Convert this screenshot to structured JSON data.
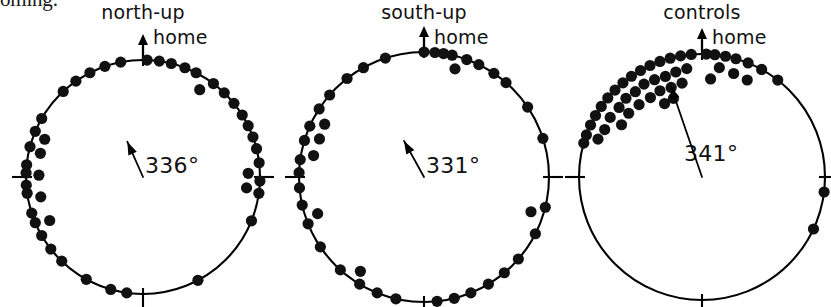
{
  "figure": {
    "caption_fragment": "oming.",
    "point_color": "#111111",
    "line_color": "#000000",
    "background": "#ffffff"
  },
  "panels": [
    {
      "id": "north-up",
      "title": "north-up",
      "home_label": "home",
      "mean_label": "336°",
      "mean_bearing_deg": 336,
      "center_x": 143,
      "center_y": 177,
      "radius": 117,
      "vector_length_frac": 0.33,
      "vector_tail_frac": 0.0
    },
    {
      "id": "south-up",
      "title": "south-up",
      "home_label": "home",
      "mean_label": "331°",
      "mean_bearing_deg": 331,
      "center_x": 424,
      "center_y": 177,
      "radius": 125,
      "vector_length_frac": 0.33,
      "vector_tail_frac": 0.0
    },
    {
      "id": "controls",
      "title": "controls",
      "home_label": "home",
      "mean_label": "341°",
      "mean_bearing_deg": 341,
      "center_x": 702,
      "center_y": 177,
      "radius": 123,
      "vector_length_frac": 0.78,
      "vector_tail_frac": 0.0
    }
  ],
  "chart_data": {
    "type": "scatter",
    "subtype": "circular-distribution",
    "title": "",
    "xlabel": "",
    "ylabel": "",
    "grid": false,
    "legend": false,
    "units": "degrees",
    "angle_convention": "0 degrees = home direction = up; angles increase clockwise",
    "radius_note": "value 1.00 = point sits on circle perimeter; smaller values are stacked radially inward to show tied bearings",
    "axis_ticks_deg": [
      0,
      90,
      180,
      270
    ],
    "series": [
      {
        "name": "north-up",
        "mean_vector_deg": 336,
        "n": 45,
        "points": [
          {
            "deg": 2,
            "r": 1.0
          },
          {
            "deg": 8,
            "r": 1.0
          },
          {
            "deg": 349,
            "r": 1.0
          },
          {
            "deg": 341,
            "r": 1.0
          },
          {
            "deg": 333,
            "r": 1.0
          },
          {
            "deg": 325,
            "r": 1.0
          },
          {
            "deg": 317,
            "r": 1.0
          },
          {
            "deg": 300,
            "r": 1.0
          },
          {
            "deg": 293,
            "r": 1.0
          },
          {
            "deg": 291,
            "r": 0.9
          },
          {
            "deg": 285,
            "r": 1.0
          },
          {
            "deg": 283,
            "r": 0.9
          },
          {
            "deg": 276,
            "r": 1.0
          },
          {
            "deg": 272,
            "r": 1.0
          },
          {
            "deg": 271,
            "r": 0.89
          },
          {
            "deg": 266,
            "r": 1.0
          },
          {
            "deg": 262,
            "r": 1.0
          },
          {
            "deg": 259,
            "r": 0.89
          },
          {
            "deg": 252,
            "r": 1.0
          },
          {
            "deg": 247,
            "r": 1.0
          },
          {
            "deg": 245,
            "r": 0.88
          },
          {
            "deg": 240,
            "r": 1.0
          },
          {
            "deg": 232,
            "r": 1.0
          },
          {
            "deg": 224,
            "r": 1.0
          },
          {
            "deg": 209,
            "r": 1.0
          },
          {
            "deg": 196,
            "r": 1.0
          },
          {
            "deg": 188,
            "r": 1.0
          },
          {
            "deg": 152,
            "r": 1.0
          },
          {
            "deg": 112,
            "r": 1.0
          },
          {
            "deg": 98,
            "r": 1.0
          },
          {
            "deg": 96,
            "r": 0.89
          },
          {
            "deg": 92,
            "r": 1.0
          },
          {
            "deg": 88,
            "r": 0.9
          },
          {
            "deg": 83,
            "r": 1.0
          },
          {
            "deg": 76,
            "r": 1.0
          },
          {
            "deg": 70,
            "r": 1.0
          },
          {
            "deg": 64,
            "r": 1.0
          },
          {
            "deg": 58,
            "r": 1.0
          },
          {
            "deg": 51,
            "r": 1.0
          },
          {
            "deg": 44,
            "r": 1.0
          },
          {
            "deg": 37,
            "r": 1.0
          },
          {
            "deg": 33,
            "r": 0.89
          },
          {
            "deg": 27,
            "r": 1.0
          },
          {
            "deg": 21,
            "r": 1.0
          },
          {
            "deg": 14,
            "r": 1.0
          }
        ]
      },
      {
        "name": "south-up",
        "mean_vector_deg": 331,
        "n": 42,
        "points": [
          {
            "deg": 0,
            "r": 1.0
          },
          {
            "deg": 5,
            "r": 1.0
          },
          {
            "deg": 9,
            "r": 1.0
          },
          {
            "deg": 13,
            "r": 1.0
          },
          {
            "deg": 16,
            "r": 0.9
          },
          {
            "deg": 20,
            "r": 1.0
          },
          {
            "deg": 26,
            "r": 1.0
          },
          {
            "deg": 34,
            "r": 1.0
          },
          {
            "deg": 41,
            "r": 1.0
          },
          {
            "deg": 56,
            "r": 1.0
          },
          {
            "deg": 72,
            "r": 1.0
          },
          {
            "deg": 104,
            "r": 1.0
          },
          {
            "deg": 108,
            "r": 0.9
          },
          {
            "deg": 117,
            "r": 1.0
          },
          {
            "deg": 131,
            "r": 1.0
          },
          {
            "deg": 140,
            "r": 1.0
          },
          {
            "deg": 149,
            "r": 1.0
          },
          {
            "deg": 158,
            "r": 1.0
          },
          {
            "deg": 166,
            "r": 1.0
          },
          {
            "deg": 174,
            "r": 1.0
          },
          {
            "deg": 193,
            "r": 1.0
          },
          {
            "deg": 202,
            "r": 1.0
          },
          {
            "deg": 211,
            "r": 1.0
          },
          {
            "deg": 214,
            "r": 0.91
          },
          {
            "deg": 222,
            "r": 1.0
          },
          {
            "deg": 236,
            "r": 1.0
          },
          {
            "deg": 248,
            "r": 1.0
          },
          {
            "deg": 251,
            "r": 0.9
          },
          {
            "deg": 257,
            "r": 1.0
          },
          {
            "deg": 265,
            "r": 1.0
          },
          {
            "deg": 272,
            "r": 1.0
          },
          {
            "deg": 278,
            "r": 1.0
          },
          {
            "deg": 281,
            "r": 0.9
          },
          {
            "deg": 287,
            "r": 1.0
          },
          {
            "deg": 290,
            "r": 0.89
          },
          {
            "deg": 294,
            "r": 1.0
          },
          {
            "deg": 298,
            "r": 0.9
          },
          {
            "deg": 303,
            "r": 1.0
          },
          {
            "deg": 311,
            "r": 1.0
          },
          {
            "deg": 322,
            "r": 1.0
          },
          {
            "deg": 331,
            "r": 1.0
          },
          {
            "deg": 342,
            "r": 1.0
          }
        ]
      },
      {
        "name": "controls",
        "mean_vector_deg": 341,
        "n": 48,
        "points": [
          {
            "deg": 2,
            "r": 1.0
          },
          {
            "deg": 6,
            "r": 1.0
          },
          {
            "deg": 11,
            "r": 1.0
          },
          {
            "deg": 16,
            "r": 1.0
          },
          {
            "deg": 22,
            "r": 1.0
          },
          {
            "deg": 29,
            "r": 1.0
          },
          {
            "deg": 38,
            "r": 1.0
          },
          {
            "deg": 9,
            "r": 0.9
          },
          {
            "deg": 17,
            "r": 0.88
          },
          {
            "deg": 25,
            "r": 0.87
          },
          {
            "deg": 5,
            "r": 0.8
          },
          {
            "deg": 355,
            "r": 1.0
          },
          {
            "deg": 350,
            "r": 1.0
          },
          {
            "deg": 345,
            "r": 1.0
          },
          {
            "deg": 340,
            "r": 1.0
          },
          {
            "deg": 335,
            "r": 1.0
          },
          {
            "deg": 330,
            "r": 1.0
          },
          {
            "deg": 325,
            "r": 1.0
          },
          {
            "deg": 320,
            "r": 1.0
          },
          {
            "deg": 315,
            "r": 1.0
          },
          {
            "deg": 310,
            "r": 1.0
          },
          {
            "deg": 305,
            "r": 1.0
          },
          {
            "deg": 300,
            "r": 1.0
          },
          {
            "deg": 295,
            "r": 1.0
          },
          {
            "deg": 290,
            "r": 1.0
          },
          {
            "deg": 286,
            "r": 1.0
          },
          {
            "deg": 352,
            "r": 0.89
          },
          {
            "deg": 346,
            "r": 0.88
          },
          {
            "deg": 340,
            "r": 0.87
          },
          {
            "deg": 334,
            "r": 0.88
          },
          {
            "deg": 328,
            "r": 0.89
          },
          {
            "deg": 322,
            "r": 0.88
          },
          {
            "deg": 316,
            "r": 0.89
          },
          {
            "deg": 310,
            "r": 0.88
          },
          {
            "deg": 303,
            "r": 0.89
          },
          {
            "deg": 296,
            "r": 0.88
          },
          {
            "deg": 290,
            "r": 0.9
          },
          {
            "deg": 348,
            "r": 0.78
          },
          {
            "deg": 341,
            "r": 0.77
          },
          {
            "deg": 334,
            "r": 0.78
          },
          {
            "deg": 327,
            "r": 0.77
          },
          {
            "deg": 319,
            "r": 0.78
          },
          {
            "deg": 311,
            "r": 0.79
          },
          {
            "deg": 303,
            "r": 0.78
          },
          {
            "deg": 340,
            "r": 0.68
          },
          {
            "deg": 333,
            "r": 0.67
          },
          {
            "deg": 97,
            "r": 1.0
          },
          {
            "deg": 115,
            "r": 1.0
          }
        ]
      }
    ]
  }
}
